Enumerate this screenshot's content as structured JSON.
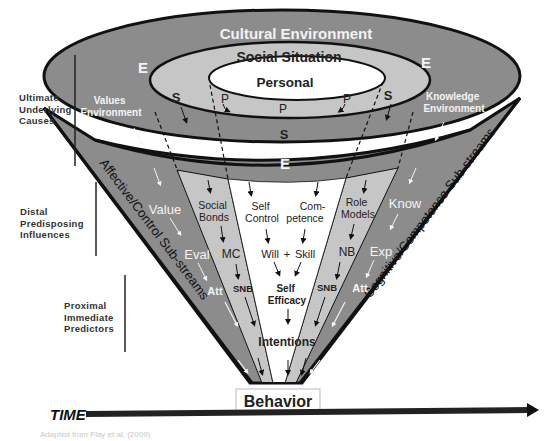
{
  "diagram": {
    "title_rings": {
      "outer": "Cultural Environment",
      "middle": "Social Situation",
      "inner": "Personal"
    },
    "ring_markers": {
      "outer_left": "E",
      "outer_right": "E",
      "outer_bottom": "E",
      "middle_left": "S",
      "middle_right": "S",
      "middle_bottom": "S",
      "inner_left": "P",
      "inner_right": "P",
      "inner_bottom": "P"
    },
    "environment_labels": {
      "values": [
        "Values",
        "Environment"
      ],
      "knowledge": [
        "Knowledge",
        "Environment"
      ]
    },
    "streams": {
      "left": "Affective/Control Sub-streams",
      "right": "Cognitive/Competence Sub-streams"
    },
    "left_outer_band": {
      "top": "Value",
      "mid": "Eval",
      "bottom": "Att"
    },
    "left_inner_band": {
      "top": [
        "Social",
        "Bonds"
      ],
      "mid": "MC",
      "bottom": "SNB"
    },
    "center": {
      "left_top": [
        "Self",
        "Control"
      ],
      "right_top": [
        "Com-",
        "petence"
      ],
      "will": "Will",
      "plus": "+",
      "skill": "Skill",
      "efficacy": [
        "Self",
        "Efficacy"
      ],
      "intentions": "Intentions"
    },
    "right_inner_band": {
      "top": [
        "Role",
        "Models"
      ],
      "mid": "NB",
      "bottom": "SNB"
    },
    "right_outer_band": {
      "top": "Know",
      "mid": "Exp",
      "bottom": "Att"
    },
    "outcome": "Behavior",
    "time_label": "TIME",
    "levels": [
      {
        "lines": [
          "Ultimate",
          "Underlying",
          "Causes"
        ]
      },
      {
        "lines": [
          "Distal",
          "Predisposing",
          "Influences"
        ]
      },
      {
        "lines": [
          "Proximal",
          "Immediate",
          "Predictors"
        ]
      }
    ],
    "caption": "Adapted from Flay et al. (2009)"
  },
  "colors": {
    "outer_ring": "#8c8c8c",
    "middle_ring": "#c6c6c6",
    "inner": "#ffffff",
    "stroke": "#111111",
    "light_text": "#f2f2f2"
  }
}
